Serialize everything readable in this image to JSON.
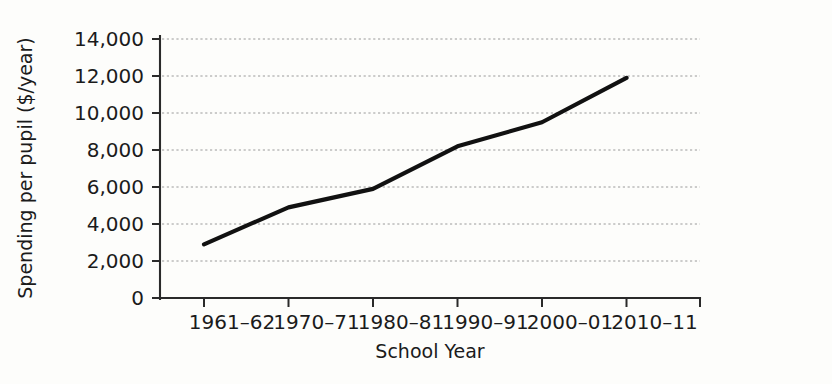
{
  "chart_data": {
    "type": "line",
    "title": "",
    "xlabel": "School Year",
    "ylabel": "Spending per pupil ($/year)",
    "categories": [
      "1961–62",
      "1970–71",
      "1980–81",
      "1990–91",
      "2000–01",
      "2010–11"
    ],
    "values": [
      2900,
      4900,
      5900,
      8200,
      9500,
      11900
    ],
    "series": [
      {
        "name": "Spending per pupil",
        "values": [
          2900,
          4900,
          5900,
          8200,
          9500,
          11900
        ]
      }
    ],
    "ytick_labels": [
      "0",
      "2,000",
      "4,000",
      "6,000",
      "8,000",
      "10,000",
      "12,000",
      "14,000"
    ],
    "ytick_values": [
      0,
      2000,
      4000,
      6000,
      8000,
      10000,
      12000,
      14000
    ],
    "ylim": [
      0,
      14000
    ],
    "xlim": [
      0,
      5
    ],
    "grid": true,
    "grid_axis": "y",
    "legend": false,
    "legend_position": "none",
    "line_color": "#111111",
    "grid_color": "#9a9a9a",
    "axis_color": "#2a2a2a",
    "background_color": "#fdfdfb"
  },
  "axis_titles": {
    "y": "Spending per pupil ($/year)",
    "x": "School Year"
  }
}
